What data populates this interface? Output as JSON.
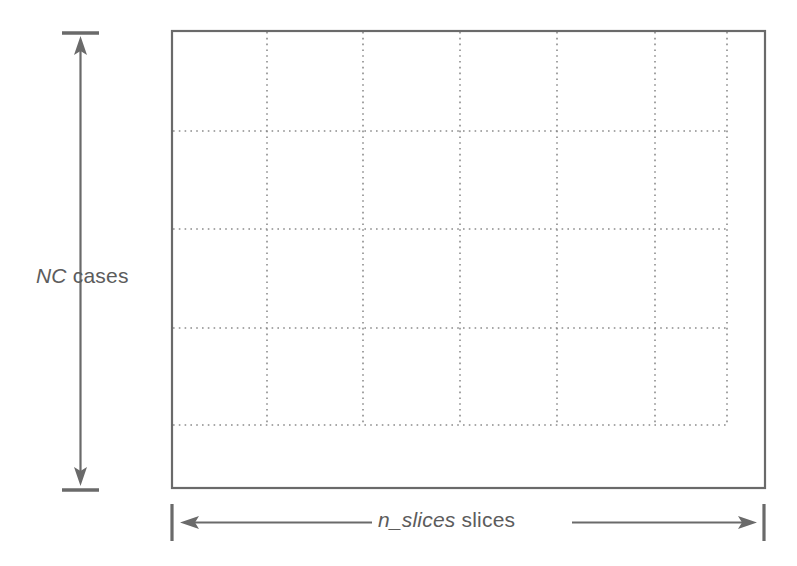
{
  "diagram": {
    "background_color": "#ffffff",
    "line_color": "#6a6a6a",
    "grid_color": "#8c8c8c",
    "text_color": "#5c5c5c"
  },
  "y_axis": {
    "label_italic": "NC",
    "label_regular": " cases",
    "label_full": "NC cases",
    "orientation": "vertical",
    "arrow_style": "double-headed",
    "tick_top_y": 33,
    "tick_bottom_y": 490
  },
  "x_axis": {
    "label_italic": "n_slices",
    "label_regular": " slices",
    "label_full": "n_slices slices",
    "orientation": "horizontal",
    "arrow_style": "double-headed",
    "tick_left_x": 172,
    "tick_right_x": 764
  },
  "outer_box": {
    "x": 172,
    "y": 31,
    "width": 593,
    "height": 457,
    "stroke": "#6a6a6a",
    "stroke_width": 2,
    "fill": "#ffffff"
  },
  "grid": {
    "style": "dotted",
    "stroke": "#8c8c8c",
    "columns": 5,
    "rows": 4,
    "vertical_lines_x": [
      267,
      363,
      460,
      557,
      655,
      727
    ],
    "horizontal_lines_y": [
      131,
      229,
      328,
      425
    ],
    "grid_right_x": 727,
    "grid_bottom_y": 425,
    "grid_left_x": 173,
    "grid_top_y": 32
  }
}
